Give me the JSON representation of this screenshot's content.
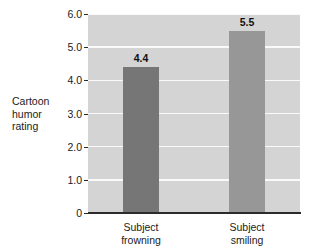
{
  "chart_data": {
    "type": "bar",
    "title": "",
    "subtitle": "",
    "xlabel": "",
    "ylabel": "Cartoon\nhumor\nrating",
    "categories": [
      "Subject\nfrowning",
      "Subject\nsmiling"
    ],
    "values": [
      4.4,
      5.5
    ],
    "value_labels": [
      "4.4",
      "5.5"
    ],
    "ylim": [
      0,
      6.0
    ],
    "yticks": [
      6.0,
      5.0,
      4.0,
      3.0,
      2.0,
      1.0,
      0
    ],
    "ytick_labels": [
      "6.0",
      "5.0",
      "4.0",
      "3.0",
      "2.0",
      "1.0",
      "0"
    ],
    "grid": true,
    "grid_color": "#fafafa",
    "legend": null,
    "legend_position": "none",
    "plot_background": "#d4d4d4",
    "figure_background": "#ffffff",
    "bar_colors": [
      "#767676",
      "#979797"
    ],
    "axis_color": "#2b2b2b"
  }
}
